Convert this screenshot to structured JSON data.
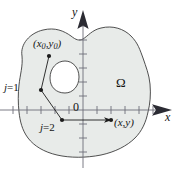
{
  "figure": {
    "type": "math-diagram",
    "background_color": "#ffffff",
    "region_fill_color": "#e8ebe9",
    "outline_color": "#3c3c3c",
    "axis_color": "#6e6e78",
    "ink_color": "#141414"
  },
  "axes": {
    "y_label": "y",
    "x_label": "x",
    "origin_label": "0",
    "x_tick_count": 11,
    "y_tick_count": 9,
    "tick_spacing_px": 14,
    "origin_px": {
      "x": 83,
      "y": 110
    }
  },
  "labels": {
    "region": "Ω",
    "initial_point": {
      "open": "(",
      "x": "x",
      "x_sub": "0",
      "comma": ",",
      "y": "y",
      "y_sub": "0",
      "close": ")"
    },
    "target_point": {
      "open": "(",
      "x": "x",
      "comma": ",",
      "y": "y",
      "close": ")"
    },
    "step_one": {
      "var": "j",
      "eq": "=",
      "value": "1"
    },
    "step_two": {
      "var": "j",
      "eq": "=",
      "value": "2"
    }
  },
  "points": [
    {
      "name": "initial-point",
      "label": "(x0,y0)",
      "px": {
        "x": 49,
        "y": 56
      }
    },
    {
      "name": "step-one-point",
      "label": "j=1",
      "px": {
        "x": 41,
        "y": 90
      }
    },
    {
      "name": "step-two-point",
      "label": "j=2",
      "px": {
        "x": 62,
        "y": 120
      }
    },
    {
      "name": "target-point",
      "label": "(x,y)",
      "px": {
        "x": 111,
        "y": 120
      }
    }
  ],
  "path_segments": [
    {
      "from": "initial-point",
      "to": "step-one-point",
      "arrow": false
    },
    {
      "from": "step-one-point",
      "to": "step-two-point",
      "arrow": false
    },
    {
      "from": "step-two-point",
      "to": "target-point",
      "arrow": true
    }
  ]
}
